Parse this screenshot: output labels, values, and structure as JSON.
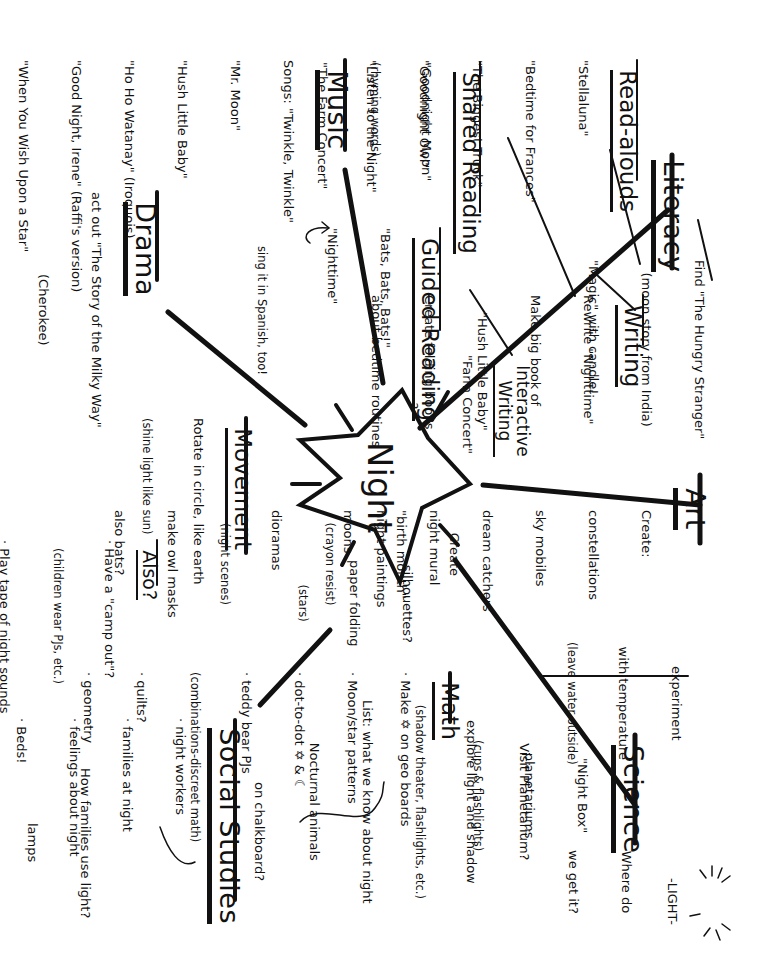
{
  "center": {
    "label": "Night"
  },
  "branches": {
    "literacy": {
      "heading": "Literacy",
      "note": [
        "Find \"The Hungry Stranger\"",
        "(moon story from India)",
        "\"Magic\" with candle!"
      ],
      "read_alouds": {
        "heading": "Read-alouds",
        "items": [
          "\"Stellaluna\"",
          "\"Bedtime for Frances\"",
          "\"The Biggest Truck\"",
          "\"Goodnight Owl\"",
          "\"Listen to the Night\""
        ]
      },
      "shared_reading": {
        "heading": "Shared Reading",
        "items": [
          "\"Goodnight Moon\"",
          "(rhyming words)",
          "\"The Farm Concert\""
        ]
      },
      "guided_reading": {
        "heading": "Guided Reading",
        "items": [
          "\"Bats, Bats, Bats!\"",
          "\"Nighttime\""
        ]
      },
      "writing": {
        "heading": "Writing",
        "items": [
          "Rewrite \"Nighttime\"",
          "Make big book of",
          "\"Hush Little Baby\"",
          "Create folding books",
          "about bedtime routines"
        ]
      },
      "interactive_writing": {
        "heading": "Interactive Writing",
        "heading_lines": [
          "Interactive",
          "Writing"
        ],
        "items": [
          "\"Farm Concert\"",
          "?"
        ]
      }
    },
    "art": {
      "heading": "Art",
      "items": [
        "Create:",
        "constellations",
        "sky mobiles",
        "dream catchers",
        "night mural",
        "night paintings",
        "(crayon resist)",
        "dioramas",
        "(night scenes)",
        "make owl masks",
        "also bats?"
      ],
      "extra": [
        "Create",
        "\"birth month\"",
        "moons"
      ],
      "extra2": [
        "-silhouettes?",
        "paper folding",
        "(stars)"
      ]
    },
    "science": {
      "heading": "Science",
      "items": [
        "\"Night Box\"",
        "planetariums",
        "(cups & flashlights)",
        "Visit Planetarium?",
        "explore light and shadow",
        "(shadow theater, flashlights, etc.)",
        "List: what we know about night",
        "Nocturnal animals"
      ],
      "experiment": [
        "experiment",
        "with temperature",
        "(leave water outside)"
      ],
      "light_question": [
        "Where do",
        "we get it?"
      ],
      "light_label": "-LIGHT-"
    },
    "math": {
      "heading": "Math",
      "items": [
        "· Make ✡ on geo boards",
        "· Moon/star patterns",
        "· dot-to-dot ✡ & ☾",
        "· teddy bear PJs",
        "(combinations-discreet math)",
        "· quilts?",
        "· geometry"
      ],
      "note": "on chalkboard?"
    },
    "social_studies": {
      "heading": "Social Studies",
      "items": [
        "· night workers",
        "· families at night",
        "· feelings about night",
        "· Beds!"
      ],
      "note": [
        "How families use light?",
        "lamps",
        "candles",
        "electricity"
      ]
    },
    "movement": {
      "heading": "Movement",
      "items": [
        "Rotate in circle, like earth",
        "(shine light like sun)"
      ]
    },
    "also": {
      "heading": "Also?",
      "items": [
        "· Have a \"camp out\"?",
        "(children wear PJs, etc.)",
        "· Play tape of night sounds",
        "(kids guess sounds)",
        "· myths & legends about night",
        "· poems: \"Star Light, Star Bright\""
      ]
    },
    "drama": {
      "heading": "Drama",
      "items": [
        "act out \"The Story of the Milky Way\"",
        "(Cherokee)",
        "and \"One Cold Wet Night\"",
        "set up tent (campsite)",
        "in drama area?",
        "or - Space",
        "Station"
      ]
    },
    "music": {
      "heading": "Music",
      "items": [
        "Songs: \"Twinkle, Twinkle\"",
        "\"Mr. Moon\"",
        "\"Hush Little Baby\"",
        "\"Ho Ho Watanay\" (Iroquois)",
        "\"Good Night, Irene\" (Raffi's version)",
        "\"When You Wish Upon a Star\"",
        "\"Moonlight Sonata\" (Beethoven)"
      ],
      "note": "sing it in Spanish, too!"
    }
  },
  "colors": {
    "ink": "#111111",
    "paper": "#ffffff"
  }
}
